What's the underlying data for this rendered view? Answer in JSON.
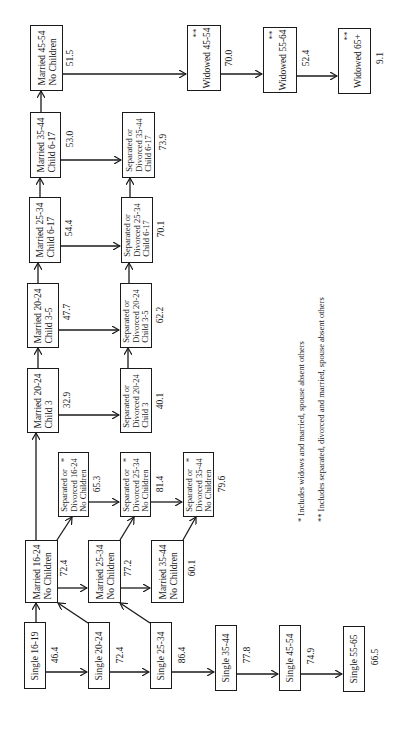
{
  "diagram": {
    "orientation": "rotated-90-ccw",
    "nodes": [
      {
        "id": "s1619",
        "lines": [
          "Single 16-19"
        ],
        "value": "46.4",
        "star": ""
      },
      {
        "id": "s2024",
        "lines": [
          "Single 20-24"
        ],
        "value": "72.4",
        "star": ""
      },
      {
        "id": "s2534",
        "lines": [
          "Single 25-34"
        ],
        "value": "86.4",
        "star": ""
      },
      {
        "id": "s3544",
        "lines": [
          "Single 35-44"
        ],
        "value": "77.8",
        "star": ""
      },
      {
        "id": "s4554",
        "lines": [
          "Single 45-54"
        ],
        "value": "74.9",
        "star": ""
      },
      {
        "id": "s5565",
        "lines": [
          "Single 55-65"
        ],
        "value": "66.5",
        "star": ""
      },
      {
        "id": "m1624nc",
        "lines": [
          "Married 16-24",
          "No Children"
        ],
        "value": "72.4",
        "star": ""
      },
      {
        "id": "m2534nc",
        "lines": [
          "Married 25-34",
          "No Children"
        ],
        "value": "77.2",
        "star": ""
      },
      {
        "id": "m3544nc",
        "lines": [
          "Married 35-44",
          "No Children"
        ],
        "value": "60.1",
        "star": ""
      },
      {
        "id": "sd1624nc",
        "lines": [
          "Separated or",
          "Divorced 16-24",
          "No Children"
        ],
        "value": "65.3",
        "star": "*"
      },
      {
        "id": "sd2534nc",
        "lines": [
          "Separated or",
          "Divorced 25-34",
          "No Children"
        ],
        "value": "81.4",
        "star": "*"
      },
      {
        "id": "sd3544nc",
        "lines": [
          "Separated or",
          "Divorced 35-44",
          "No Children"
        ],
        "value": "79.6",
        "star": "*"
      },
      {
        "id": "m2024c3",
        "lines": [
          "Married 20-24",
          "Child  3"
        ],
        "value": "32.9",
        "star": ""
      },
      {
        "id": "sd2024c3",
        "lines": [
          "Separated or",
          "Divorced 20-24",
          "Child  3"
        ],
        "value": "40.1",
        "star": ""
      },
      {
        "id": "m2024c35",
        "lines": [
          "Married 20-24",
          "Child 3-5"
        ],
        "value": "47.7",
        "star": ""
      },
      {
        "id": "sd2024c35",
        "lines": [
          "Separated or",
          "Divorced 20-24",
          "Child 3-5"
        ],
        "value": "62.2",
        "star": ""
      },
      {
        "id": "m2534c617",
        "lines": [
          "Married 25-34",
          "Child 6-17"
        ],
        "value": "54.4",
        "star": ""
      },
      {
        "id": "sd2534c617",
        "lines": [
          "Separated or",
          "Divorced 25-34",
          "Child 6-17"
        ],
        "value": "70.1",
        "star": ""
      },
      {
        "id": "m3544c617",
        "lines": [
          "Married 35-44",
          "Child 6-17"
        ],
        "value": "53.0",
        "star": ""
      },
      {
        "id": "sd3544c617",
        "lines": [
          "Separated or",
          "Divorced 35-44",
          "Child 6-17"
        ],
        "value": "73.9",
        "star": ""
      },
      {
        "id": "m4554nc",
        "lines": [
          "Married 45-54",
          "No Children"
        ],
        "value": "51.5",
        "star": ""
      },
      {
        "id": "w4554",
        "lines": [
          "Widowed 45-54"
        ],
        "value": "70.0",
        "star": "**"
      },
      {
        "id": "w5564",
        "lines": [
          "Widowed 55-64"
        ],
        "value": "52.4",
        "star": "**"
      },
      {
        "id": "w65",
        "lines": [
          "Widowed 65+"
        ],
        "value": "9.1",
        "star": "**"
      }
    ],
    "edges": [
      [
        "s1619",
        "s2024"
      ],
      [
        "s2024",
        "s2534"
      ],
      [
        "s2534",
        "s3544"
      ],
      [
        "s3544",
        "s4554"
      ],
      [
        "s4554",
        "s5565"
      ],
      [
        "s1619",
        "m1624nc"
      ],
      [
        "s2024",
        "m1624nc"
      ],
      [
        "s2534",
        "m2534nc"
      ],
      [
        "m1624nc",
        "m2534nc"
      ],
      [
        "m2534nc",
        "m3544nc"
      ],
      [
        "m1624nc",
        "sd1624nc"
      ],
      [
        "m2534nc",
        "sd2534nc"
      ],
      [
        "m3544nc",
        "sd3544nc"
      ],
      [
        "sd1624nc",
        "sd2534nc"
      ],
      [
        "sd2534nc",
        "sd3544nc"
      ],
      [
        "m1624nc",
        "m2024c3"
      ],
      [
        "m2024c3",
        "m2024c35"
      ],
      [
        "m2024c35",
        "m2534c617"
      ],
      [
        "m2534c617",
        "m3544c617"
      ],
      [
        "m3544c617",
        "m4554nc"
      ],
      [
        "m2024c3",
        "sd2024c3"
      ],
      [
        "m2024c35",
        "sd2024c35"
      ],
      [
        "m2534c617",
        "sd2534c617"
      ],
      [
        "m3544c617",
        "sd3544c617"
      ],
      [
        "sd2024c3",
        "sd2024c35"
      ],
      [
        "sd2024c35",
        "sd2534c617"
      ],
      [
        "sd2534c617",
        "sd3544c617"
      ],
      [
        "m4554nc",
        "w4554"
      ],
      [
        "w4554",
        "w5564"
      ],
      [
        "w5564",
        "w65"
      ]
    ],
    "footnotes": [
      "*  Includes widows and married, spouse absent others",
      "** Includes separated, divorced and married, spouse absent others"
    ]
  }
}
